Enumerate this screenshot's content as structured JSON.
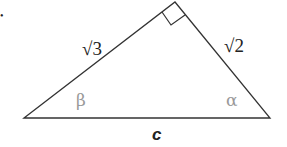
{
  "diagram": {
    "type": "right-triangle",
    "bullet": "•",
    "sides": {
      "left_leg": "√3",
      "right_leg": "√2",
      "hypotenuse": "c"
    },
    "angles": {
      "left": "β",
      "right": "α",
      "apex": "right-angle"
    },
    "colors": {
      "line": "#333333",
      "text": "#222222",
      "angle_label": "#999999"
    }
  }
}
